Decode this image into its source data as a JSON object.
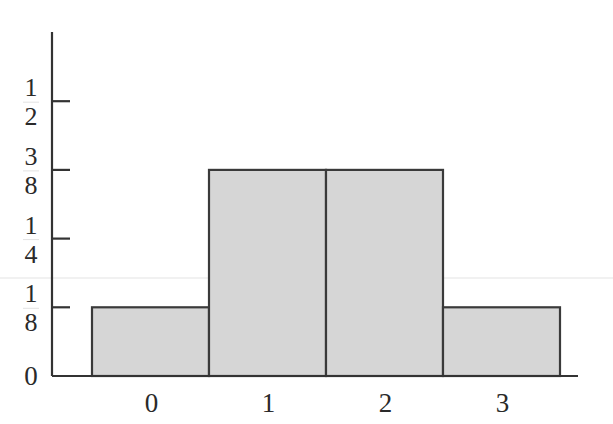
{
  "chart_data": {
    "type": "bar",
    "title": "",
    "xlabel": "",
    "ylabel": "",
    "categories": [
      "0",
      "1",
      "2",
      "3"
    ],
    "values": [
      0.125,
      0.375,
      0.375,
      0.125
    ],
    "ylim": [
      0,
      0.6
    ],
    "yticks": [
      {
        "value": 0,
        "label": "0"
      },
      {
        "value": 0.125,
        "num": "1",
        "den": "8"
      },
      {
        "value": 0.25,
        "num": "1",
        "den": "4"
      },
      {
        "value": 0.375,
        "num": "3",
        "den": "8"
      },
      {
        "value": 0.5,
        "num": "1",
        "den": "2"
      }
    ],
    "bar_gap": 0,
    "grid": false,
    "legend": "none",
    "colors": {
      "bar_fill": "#d6d6d6",
      "bar_edge": "#3a3a3a",
      "axis": "#333333"
    }
  }
}
